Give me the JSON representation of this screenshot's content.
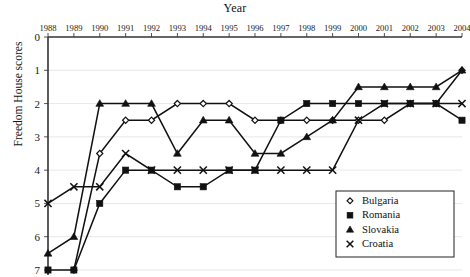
{
  "chart_data": {
    "type": "line",
    "title": "",
    "xlabel": "Year",
    "ylabel": "Freedom House scores",
    "x": [
      1988,
      1989,
      1990,
      1991,
      1992,
      1993,
      1994,
      1995,
      1996,
      1997,
      1998,
      1999,
      2000,
      2001,
      2002,
      2003,
      2004
    ],
    "xtick_labels": [
      "1988",
      "1989",
      "1990",
      "1991",
      "1992",
      "1993",
      "1994",
      "1995",
      "1996",
      "1997",
      "1998",
      "1999",
      "2000",
      "2001",
      "2002",
      "2003",
      "2004"
    ],
    "ytick_labels": [
      "0",
      "1",
      "2",
      "3",
      "4",
      "5",
      "6",
      "7"
    ],
    "ylim": [
      0,
      7
    ],
    "y_inverted": true,
    "xaxis_position": "top",
    "grid": true,
    "legend_position": "bottom-right",
    "series": [
      {
        "name": "Bulgaria",
        "marker": "diamond-open",
        "values": [
          null,
          7,
          3.5,
          2.5,
          2.5,
          2,
          2,
          2,
          2.5,
          2.5,
          2.5,
          2.5,
          2.5,
          2.5,
          2,
          2,
          1
        ]
      },
      {
        "name": "Romania",
        "marker": "square-filled",
        "values": [
          7,
          7,
          5,
          4,
          4,
          4.5,
          4.5,
          4,
          4,
          2.5,
          2,
          2,
          2,
          2,
          2,
          2,
          2.5
        ]
      },
      {
        "name": "Slovakia",
        "marker": "triangle-filled",
        "values": [
          6.5,
          6,
          2,
          2,
          2,
          3.5,
          2.5,
          2.5,
          3.5,
          3.5,
          3,
          2.5,
          1.5,
          1.5,
          1.5,
          1.5,
          1
        ]
      },
      {
        "name": "Croatia",
        "marker": "cross",
        "values": [
          5,
          4.5,
          4.5,
          3.5,
          4,
          4,
          4,
          4,
          4,
          4,
          4,
          4,
          2.5,
          2,
          2,
          2,
          2
        ]
      }
    ]
  },
  "legend": {
    "entries": [
      {
        "label": "Bulgaria",
        "marker": "diamond-open"
      },
      {
        "label": "Romania",
        "marker": "square-filled"
      },
      {
        "label": "Slovakia",
        "marker": "triangle-filled"
      },
      {
        "label": "Croatia",
        "marker": "cross"
      }
    ]
  },
  "colors": {
    "ink": "#111111",
    "grid": "#dddddd",
    "axis": "#333333",
    "background": "#ffffff"
  }
}
